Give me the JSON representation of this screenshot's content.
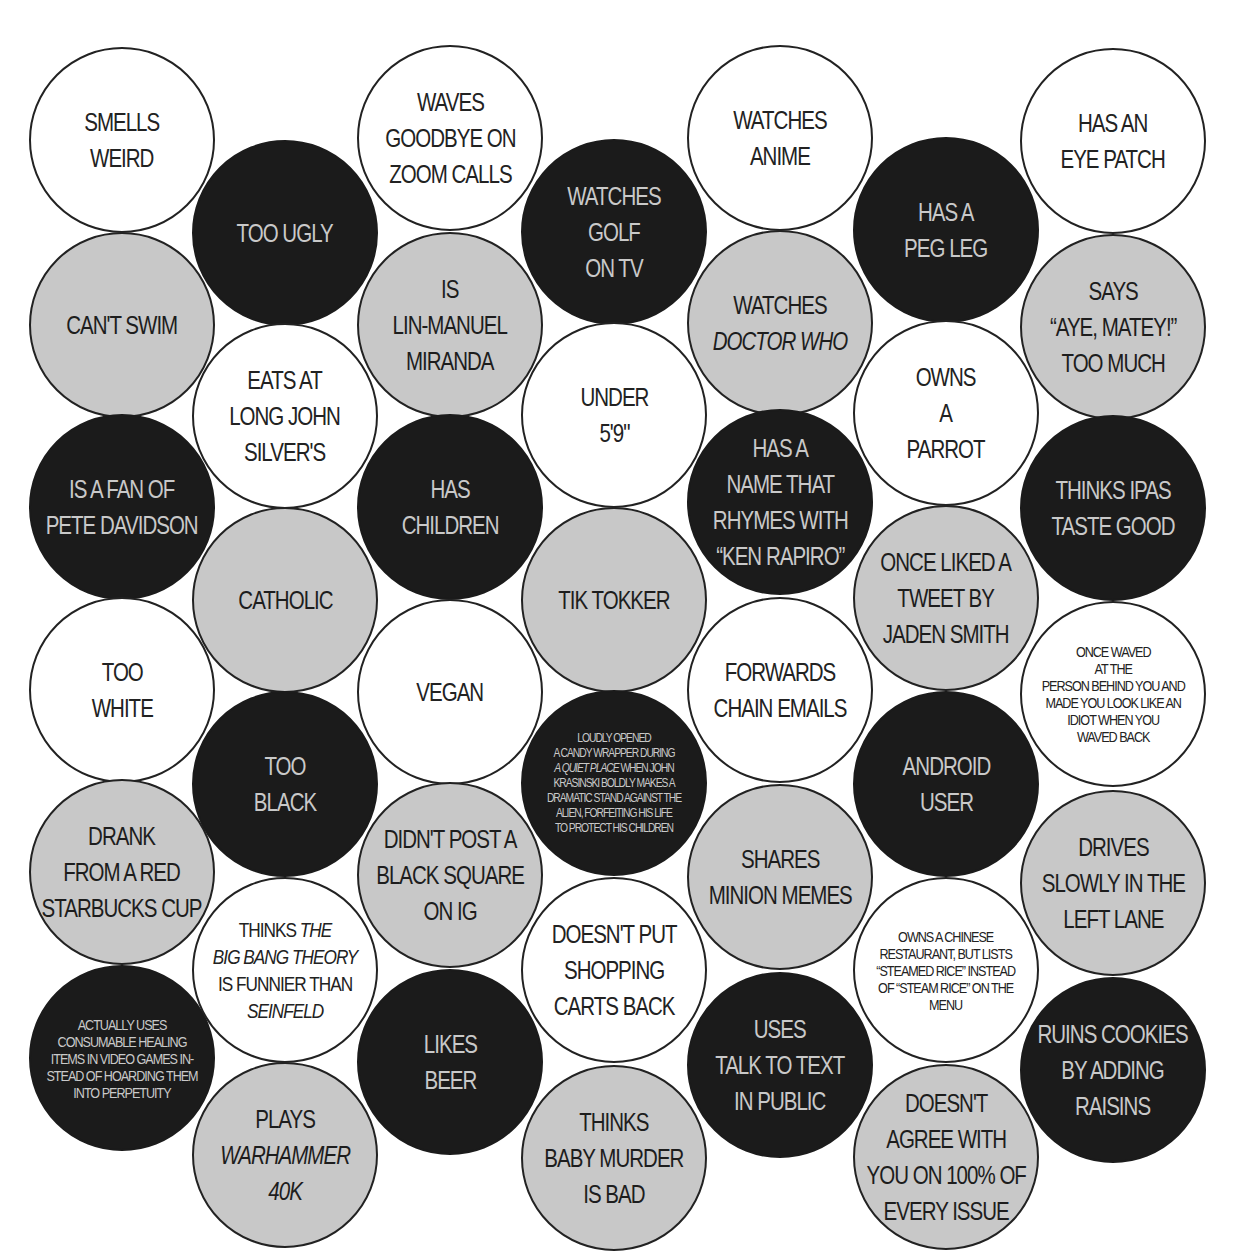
{
  "colors": {
    "white": "#ffffff",
    "gray": "#c8c8c8",
    "black": "#1b1b1b",
    "outline": "#222222"
  },
  "circles": [
    {
      "id": "c1",
      "x": 122,
      "y": 140,
      "fill": "white",
      "size": "l",
      "lines": [
        {
          "t": "SMELLS"
        },
        {
          "t": "WEIRD"
        }
      ]
    },
    {
      "id": "c2",
      "x": 122,
      "y": 325,
      "fill": "gray",
      "size": "l",
      "lines": [
        {
          "t": "CAN'T SWIM"
        }
      ]
    },
    {
      "id": "c3",
      "x": 122,
      "y": 507,
      "fill": "black",
      "size": "l",
      "lines": [
        {
          "t": "IS A FAN OF"
        },
        {
          "t": "PETE DAVIDSON"
        }
      ]
    },
    {
      "id": "c4",
      "x": 122,
      "y": 690,
      "fill": "white",
      "size": "l",
      "lines": [
        {
          "t": "TOO"
        },
        {
          "t": "WHITE"
        }
      ]
    },
    {
      "id": "c5",
      "x": 122,
      "y": 872,
      "fill": "gray",
      "size": "l",
      "lines": [
        {
          "t": "DRANK"
        },
        {
          "t": "FROM A RED"
        },
        {
          "t": "STARBUCKS CUP"
        }
      ]
    },
    {
      "id": "c6",
      "x": 122,
      "y": 1058,
      "fill": "black",
      "size": "s",
      "lines": [
        {
          "t": "ACTUALLY USES"
        },
        {
          "t": "CONSUMABLE HEALING"
        },
        {
          "t": "ITEMS IN VIDEO GAMES IN-"
        },
        {
          "t": "STEAD OF HOARDING THEM"
        },
        {
          "t": "INTO PERPETUITY"
        }
      ]
    },
    {
      "id": "c7",
      "x": 285,
      "y": 233,
      "fill": "black",
      "size": "l",
      "lines": [
        {
          "t": "TOO UGLY"
        }
      ]
    },
    {
      "id": "c8",
      "x": 285,
      "y": 416,
      "fill": "white",
      "size": "l",
      "lines": [
        {
          "t": "EATS AT"
        },
        {
          "t": "LONG JOHN"
        },
        {
          "t": "SILVER'S"
        }
      ]
    },
    {
      "id": "c9",
      "x": 285,
      "y": 600,
      "fill": "gray",
      "size": "l",
      "lines": [
        {
          "t": "CATHOLIC"
        }
      ]
    },
    {
      "id": "c10",
      "x": 285,
      "y": 784,
      "fill": "black",
      "size": "l",
      "lines": [
        {
          "t": "TOO"
        },
        {
          "t": "BLACK"
        }
      ]
    },
    {
      "id": "c11",
      "x": 285,
      "y": 970,
      "fill": "white",
      "size": "m",
      "lines": [
        {
          "t": "THINKS ",
          "it": "THE"
        },
        {
          "t": "",
          "it": "BIG BANG THEORY"
        },
        {
          "t": "IS FUNNIER THAN"
        },
        {
          "t": "",
          "it": "SEINFELD"
        }
      ]
    },
    {
      "id": "c12",
      "x": 285,
      "y": 1155,
      "fill": "gray",
      "size": "l",
      "lines": [
        {
          "t": "PLAYS"
        },
        {
          "t": "",
          "it": "WARHAMMER"
        },
        {
          "t": "",
          "it": "40K"
        }
      ]
    },
    {
      "id": "c13",
      "x": 450,
      "y": 138,
      "fill": "white",
      "size": "l",
      "lines": [
        {
          "t": "WAVES"
        },
        {
          "t": "GOODBYE ON"
        },
        {
          "t": "ZOOM CALLS"
        }
      ]
    },
    {
      "id": "c14",
      "x": 450,
      "y": 325,
      "fill": "gray",
      "size": "l",
      "lines": [
        {
          "t": "IS"
        },
        {
          "t": "LIN-MANUEL"
        },
        {
          "t": "MIRANDA"
        }
      ]
    },
    {
      "id": "c15",
      "x": 450,
      "y": 507,
      "fill": "black",
      "size": "l",
      "lines": [
        {
          "t": "HAS"
        },
        {
          "t": "CHILDREN"
        }
      ]
    },
    {
      "id": "c16",
      "x": 450,
      "y": 692,
      "fill": "white",
      "size": "l",
      "lines": [
        {
          "t": "VEGAN"
        }
      ]
    },
    {
      "id": "c17",
      "x": 450,
      "y": 875,
      "fill": "gray",
      "size": "l",
      "lines": [
        {
          "t": "DIDN'T POST A"
        },
        {
          "t": "BLACK SQUARE"
        },
        {
          "t": "ON IG"
        }
      ]
    },
    {
      "id": "c18",
      "x": 450,
      "y": 1062,
      "fill": "black",
      "size": "l",
      "lines": [
        {
          "t": "LIKES"
        },
        {
          "t": "BEER"
        }
      ]
    },
    {
      "id": "c19",
      "x": 614,
      "y": 232,
      "fill": "black",
      "size": "l",
      "lines": [
        {
          "t": "WATCHES"
        },
        {
          "t": "GOLF"
        },
        {
          "t": "ON TV"
        }
      ]
    },
    {
      "id": "c20",
      "x": 614,
      "y": 415,
      "fill": "white",
      "size": "l",
      "lines": [
        {
          "t": "UNDER"
        },
        {
          "t": "5'9\""
        }
      ]
    },
    {
      "id": "c21",
      "x": 614,
      "y": 600,
      "fill": "gray",
      "size": "l",
      "lines": [
        {
          "t": "TIK TOKKER"
        }
      ]
    },
    {
      "id": "c22",
      "x": 614,
      "y": 783,
      "fill": "black",
      "size": "xs",
      "lines": [
        {
          "t": "LOUDLY OPENED"
        },
        {
          "t": "A CANDY WRAPPER DURING"
        },
        {
          "t": " WHEN JOHN",
          "it_pre": "A QUIET PLACE"
        },
        {
          "t": "KRASINSKI BOLDLY MAKES A"
        },
        {
          "t": "DRAMATIC STAND AGAINST THE"
        },
        {
          "t": "ALIEN,  FORFEITING HIS LIFE"
        },
        {
          "t": "TO PROTECT HIS CHILDREN"
        }
      ]
    },
    {
      "id": "c23",
      "x": 614,
      "y": 970,
      "fill": "white",
      "size": "l",
      "lines": [
        {
          "t": "DOESN'T PUT"
        },
        {
          "t": "SHOPPING"
        },
        {
          "t": "CARTS BACK"
        }
      ]
    },
    {
      "id": "c24",
      "x": 614,
      "y": 1158,
      "fill": "gray",
      "size": "l",
      "lines": [
        {
          "t": "THINKS"
        },
        {
          "t": "BABY MURDER"
        },
        {
          "t": "IS BAD"
        }
      ]
    },
    {
      "id": "c25",
      "x": 780,
      "y": 138,
      "fill": "white",
      "size": "l",
      "lines": [
        {
          "t": "WATCHES"
        },
        {
          "t": "ANIME"
        }
      ]
    },
    {
      "id": "c26",
      "x": 780,
      "y": 323,
      "fill": "gray",
      "size": "l",
      "lines": [
        {
          "t": "WATCHES"
        },
        {
          "t": "",
          "it": "DOCTOR WHO"
        }
      ]
    },
    {
      "id": "c27",
      "x": 780,
      "y": 502,
      "fill": "black",
      "size": "l",
      "lines": [
        {
          "t": "HAS A"
        },
        {
          "t": "NAME THAT"
        },
        {
          "t": "RHYMES WITH"
        },
        {
          "t": "“KEN RAPIRO”"
        }
      ]
    },
    {
      "id": "c28",
      "x": 780,
      "y": 690,
      "fill": "white",
      "size": "l",
      "lines": [
        {
          "t": "FORWARDS"
        },
        {
          "t": "CHAIN EMAILS"
        }
      ]
    },
    {
      "id": "c29",
      "x": 780,
      "y": 877,
      "fill": "gray",
      "size": "l",
      "lines": [
        {
          "t": "SHARES"
        },
        {
          "t": "MINION MEMES"
        }
      ]
    },
    {
      "id": "c30",
      "x": 780,
      "y": 1065,
      "fill": "black",
      "size": "l",
      "lines": [
        {
          "t": "USES"
        },
        {
          "t": "TALK TO TEXT"
        },
        {
          "t": "IN PUBLIC"
        }
      ]
    },
    {
      "id": "c31",
      "x": 946,
      "y": 230,
      "fill": "black",
      "size": "l",
      "lines": [
        {
          "t": "HAS A"
        },
        {
          "t": "PEG LEG"
        }
      ]
    },
    {
      "id": "c32",
      "x": 946,
      "y": 413,
      "fill": "white",
      "size": "l",
      "lines": [
        {
          "t": "OWNS"
        },
        {
          "t": "A"
        },
        {
          "t": "PARROT"
        }
      ]
    },
    {
      "id": "c33",
      "x": 946,
      "y": 598,
      "fill": "gray",
      "size": "l",
      "lines": [
        {
          "t": "ONCE LIKED A"
        },
        {
          "t": "TWEET BY"
        },
        {
          "t": "JADEN SMITH"
        }
      ]
    },
    {
      "id": "c34",
      "x": 946,
      "y": 784,
      "fill": "black",
      "size": "l",
      "lines": [
        {
          "t": "ANDROID"
        },
        {
          "t": "USER"
        }
      ]
    },
    {
      "id": "c35",
      "x": 946,
      "y": 970,
      "fill": "white",
      "size": "s",
      "lines": [
        {
          "t": "OWNS A CHINESE"
        },
        {
          "t": "RESTAURANT, BUT LISTS"
        },
        {
          "t": "“STEAMED RICE” INSTEAD"
        },
        {
          "t": "OF “STEAM RICE” ON THE"
        },
        {
          "t": "MENU"
        }
      ]
    },
    {
      "id": "c36",
      "x": 946,
      "y": 1157,
      "fill": "gray",
      "size": "l",
      "lines": [
        {
          "t": "DOESN'T"
        },
        {
          "t": "AGREE WITH"
        },
        {
          "t": "YOU ON 100% OF"
        },
        {
          "t": "EVERY ISSUE"
        }
      ]
    },
    {
      "id": "c37",
      "x": 1113,
      "y": 141,
      "fill": "white",
      "size": "l",
      "lines": [
        {
          "t": "HAS AN"
        },
        {
          "t": "EYE PATCH"
        }
      ]
    },
    {
      "id": "c38",
      "x": 1113,
      "y": 327,
      "fill": "gray",
      "size": "l",
      "lines": [
        {
          "t": "SAYS"
        },
        {
          "t": "“AYE, MATEY!”"
        },
        {
          "t": "TOO MUCH"
        }
      ]
    },
    {
      "id": "c39",
      "x": 1113,
      "y": 508,
      "fill": "black",
      "size": "l",
      "lines": [
        {
          "t": "THINKS IPAs"
        },
        {
          "t": "TASTE GOOD"
        }
      ]
    },
    {
      "id": "c40",
      "x": 1113,
      "y": 694,
      "fill": "white",
      "size": "s",
      "lines": [
        {
          "t": "ONCE WAVED"
        },
        {
          "t": "AT THE"
        },
        {
          "t": "PERSON BEHIND YOU AND"
        },
        {
          "t": "MADE YOU LOOK LIKE AN"
        },
        {
          "t": "IDIOT WHEN YOU"
        },
        {
          "t": "WAVED BACK"
        }
      ]
    },
    {
      "id": "c41",
      "x": 1113,
      "y": 883,
      "fill": "gray",
      "size": "l",
      "lines": [
        {
          "t": "DRIVES"
        },
        {
          "t": "SLOWLY IN THE"
        },
        {
          "t": "LEFT LANE"
        }
      ]
    },
    {
      "id": "c42",
      "x": 1113,
      "y": 1070,
      "fill": "black",
      "size": "l",
      "lines": [
        {
          "t": "RUINS COOKIES"
        },
        {
          "t": "BY ADDING"
        },
        {
          "t": "RAISINS"
        }
      ]
    }
  ]
}
